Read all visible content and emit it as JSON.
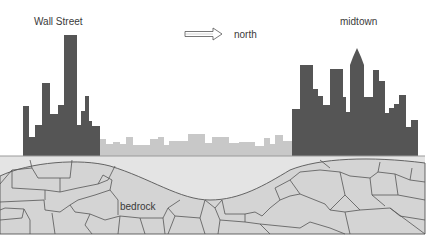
{
  "diagram": {
    "labels": {
      "wall_street": "Wall Street",
      "north": "north",
      "midtown": "midtown",
      "bedrock": "bedrock"
    },
    "icons": {
      "direction_arrow": "outline-right-arrow"
    },
    "colors": {
      "tall_buildings": "#555555",
      "low_buildings": "#c8c8c8",
      "ground_fill": "#e2e2e2",
      "bedrock_fill": "#d4d4d4",
      "bedrock_lines": "#555555",
      "background": "#ffffff"
    },
    "regions": [
      {
        "name": "Wall Street",
        "skyline": "tall",
        "bedrock": "near surface"
      },
      {
        "name": "between",
        "skyline": "low",
        "bedrock": "deep"
      },
      {
        "name": "midtown",
        "skyline": "tall",
        "bedrock": "near surface"
      }
    ]
  }
}
